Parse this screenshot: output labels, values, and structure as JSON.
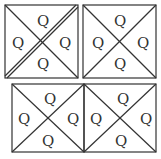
{
  "diagram": {
    "label": "Q",
    "line_color": "#333333",
    "squares": [
      {
        "id": "top-left",
        "x": 5,
        "y": 5,
        "w": 73,
        "h": 73,
        "double_diagonal": true,
        "labels": {
          "top": "Q",
          "left": "Q",
          "right": "Q",
          "bottom": "Q"
        }
      },
      {
        "id": "top-right",
        "x": 83,
        "y": 5,
        "w": 73,
        "h": 73,
        "double_diagonal": false,
        "labels": {
          "top": "Q",
          "left": "Q",
          "right": "Q",
          "bottom": "Q"
        }
      },
      {
        "id": "bottom-left",
        "x": 12,
        "y": 84,
        "w": 72,
        "h": 68,
        "double_diagonal": false,
        "labels": {
          "top": "Q",
          "left": "Q",
          "right": "Q",
          "bottom": "Q"
        }
      },
      {
        "id": "bottom-right",
        "x": 84,
        "y": 84,
        "w": 72,
        "h": 68,
        "double_diagonal": false,
        "labels": {
          "top": "Q",
          "left": "Q",
          "right": "Q",
          "bottom": "Q"
        }
      }
    ]
  }
}
